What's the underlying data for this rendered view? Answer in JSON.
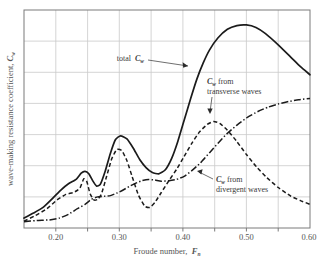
{
  "chart_data": {
    "type": "line",
    "title": "",
    "xlabel": "Froude number, F_n",
    "ylabel": "wave-making resistance coefficient, C_w",
    "xlim": [
      0.15,
      0.6
    ],
    "ylim": [
      0,
      7
    ],
    "grid": true,
    "legend_position": "inline-annotations",
    "xticks": [
      "0.20",
      "0.30",
      "0.40",
      "0.50",
      "0.60"
    ],
    "xtick_values": [
      0.2,
      0.3,
      0.4,
      0.5,
      0.6
    ],
    "xgrid_values": [
      0.2,
      0.25,
      0.3,
      0.35,
      0.4,
      0.45,
      0.5,
      0.55
    ],
    "yticks": [],
    "ygrid_values": [
      1,
      2,
      3,
      4,
      5,
      6
    ],
    "annotations": [
      {
        "id": "total",
        "text_line1": "total",
        "symbol": "C",
        "symbol_sub": "w",
        "text_line2": ""
      },
      {
        "id": "transverse",
        "symbol": "C",
        "symbol_sub": "w",
        "text_line1": "from",
        "text_line2": "transverse waves"
      },
      {
        "id": "divergent",
        "symbol": "C",
        "symbol_sub": "w",
        "text_line1": "from",
        "text_line2": "divergent waves"
      }
    ],
    "series": [
      {
        "name": "total C_w",
        "style": "solid",
        "color": "#1b1b1b",
        "x": [
          0.15,
          0.165,
          0.18,
          0.195,
          0.208,
          0.22,
          0.232,
          0.24,
          0.246,
          0.252,
          0.258,
          0.264,
          0.27,
          0.278,
          0.286,
          0.294,
          0.302,
          0.312,
          0.322,
          0.332,
          0.342,
          0.352,
          0.362,
          0.372,
          0.382,
          0.392,
          0.402,
          0.412,
          0.422,
          0.432,
          0.442,
          0.455,
          0.47,
          0.485,
          0.5,
          0.515,
          0.53,
          0.55,
          0.57,
          0.585,
          0.6
        ],
        "y": [
          0.32,
          0.48,
          0.66,
          0.95,
          1.22,
          1.42,
          1.56,
          1.76,
          1.82,
          1.74,
          1.52,
          1.35,
          1.4,
          1.84,
          2.4,
          2.84,
          2.96,
          2.86,
          2.56,
          2.2,
          1.94,
          1.78,
          1.74,
          1.86,
          2.22,
          2.78,
          3.46,
          4.14,
          4.78,
          5.3,
          5.72,
          6.1,
          6.38,
          6.5,
          6.52,
          6.44,
          6.24,
          5.88,
          5.48,
          5.18,
          4.92
        ]
      },
      {
        "name": "C_w from transverse waves",
        "style": "dashed",
        "color": "#1b1b1b",
        "x": [
          0.15,
          0.168,
          0.186,
          0.202,
          0.216,
          0.228,
          0.238,
          0.244,
          0.249,
          0.254,
          0.26,
          0.266,
          0.272,
          0.28,
          0.288,
          0.296,
          0.304,
          0.312,
          0.32,
          0.33,
          0.34,
          0.348,
          0.356,
          0.366,
          0.378,
          0.39,
          0.402,
          0.414,
          0.426,
          0.438,
          0.448,
          0.458,
          0.47,
          0.484,
          0.5,
          0.516,
          0.532,
          0.55,
          0.57,
          0.585,
          0.6
        ],
        "y": [
          0.22,
          0.4,
          0.62,
          0.9,
          1.08,
          1.14,
          1.28,
          1.58,
          1.48,
          1.1,
          0.9,
          0.92,
          1.1,
          1.66,
          2.22,
          2.52,
          2.48,
          2.16,
          1.66,
          1.06,
          0.7,
          0.66,
          0.82,
          1.14,
          1.52,
          1.88,
          2.3,
          2.72,
          3.08,
          3.32,
          3.42,
          3.36,
          3.14,
          2.8,
          2.36,
          1.96,
          1.62,
          1.3,
          1.02,
          0.88,
          0.76
        ]
      },
      {
        "name": "C_w from divergent waves",
        "style": "dash-dot",
        "color": "#1b1b1b",
        "x": [
          0.15,
          0.17,
          0.19,
          0.206,
          0.22,
          0.234,
          0.246,
          0.256,
          0.266,
          0.276,
          0.286,
          0.296,
          0.306,
          0.316,
          0.326,
          0.336,
          0.346,
          0.356,
          0.366,
          0.378,
          0.39,
          0.402,
          0.414,
          0.428,
          0.442,
          0.456,
          0.47,
          0.486,
          0.502,
          0.518,
          0.534,
          0.55,
          0.566,
          0.582,
          0.6
        ],
        "y": [
          0.2,
          0.24,
          0.26,
          0.32,
          0.44,
          0.62,
          0.76,
          0.92,
          1.0,
          1.02,
          1.04,
          1.12,
          1.22,
          1.34,
          1.44,
          1.52,
          1.56,
          1.54,
          1.5,
          1.52,
          1.56,
          1.66,
          1.84,
          2.1,
          2.42,
          2.74,
          3.04,
          3.32,
          3.56,
          3.74,
          3.88,
          3.98,
          4.06,
          4.12,
          4.16
        ]
      }
    ]
  },
  "axis": {
    "x_label_text": "Froude number,",
    "x_label_symbol": "F",
    "x_label_sub": "n",
    "y_label_text": "wave-making resistance coefficient,",
    "y_label_symbol": "C",
    "y_label_sub": "w"
  },
  "annotations": {
    "total": {
      "prefix": "total",
      "symbol": "C",
      "sub": "w"
    },
    "transverse": {
      "symbol": "C",
      "sub": "w",
      "line1_rest": "from",
      "line2": "transverse waves"
    },
    "divergent": {
      "symbol": "C",
      "sub": "w",
      "line1_rest": "from",
      "line2": "divergent waves"
    }
  }
}
